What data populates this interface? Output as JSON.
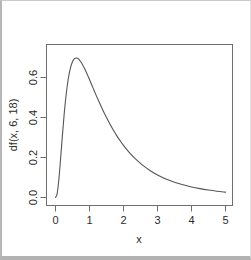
{
  "chart_data": {
    "type": "line",
    "title": "",
    "xlabel": "x",
    "ylabel": "df(x, 6, 18)",
    "xlim": [
      0,
      5
    ],
    "ylim": [
      0,
      0.8
    ],
    "grid": false,
    "legend": null,
    "xticks": [
      "0",
      "1",
      "2",
      "3",
      "4",
      "5"
    ],
    "xtick_values": [
      0,
      1,
      2,
      3,
      4,
      5
    ],
    "yticks": [
      "0.0",
      "0.2",
      "0.4",
      "0.6"
    ],
    "ytick_values": [
      0.0,
      0.2,
      0.4,
      0.6
    ],
    "series": [
      {
        "name": "df(x, 6, 18)",
        "color": "#555555",
        "x": [
          0.0,
          0.05,
          0.1,
          0.15,
          0.2,
          0.25,
          0.3,
          0.35,
          0.4,
          0.45,
          0.5,
          0.55,
          0.6,
          0.65,
          0.7,
          0.75,
          0.8,
          0.85,
          0.9,
          0.95,
          1.0,
          1.1,
          1.2,
          1.3,
          1.4,
          1.5,
          1.6,
          1.7,
          1.8,
          1.9,
          2.0,
          2.2,
          2.4,
          2.6,
          2.8,
          3.0,
          3.25,
          3.5,
          3.75,
          4.0,
          4.25,
          4.5,
          4.75,
          5.0
        ],
        "y": [
          0.0,
          0.0206,
          0.0925,
          0.1946,
          0.3042,
          0.4064,
          0.4937,
          0.5636,
          0.6165,
          0.6542,
          0.6788,
          0.6926,
          0.6977,
          0.6958,
          0.6886,
          0.6773,
          0.663,
          0.6465,
          0.6284,
          0.6093,
          0.5896,
          0.5494,
          0.5094,
          0.4708,
          0.434,
          0.3995,
          0.3672,
          0.3373,
          0.3096,
          0.2841,
          0.2607,
          0.2196,
          0.1853,
          0.1566,
          0.1327,
          0.1128,
          0.0925,
          0.0763,
          0.0633,
          0.0528,
          0.0442,
          0.0372,
          0.0314,
          0.0267
        ]
      }
    ],
    "peak": {
      "x": 0.6,
      "y": 0.698
    }
  },
  "axes": {
    "x_title": "x",
    "y_title": "df(x, 6, 18)"
  }
}
